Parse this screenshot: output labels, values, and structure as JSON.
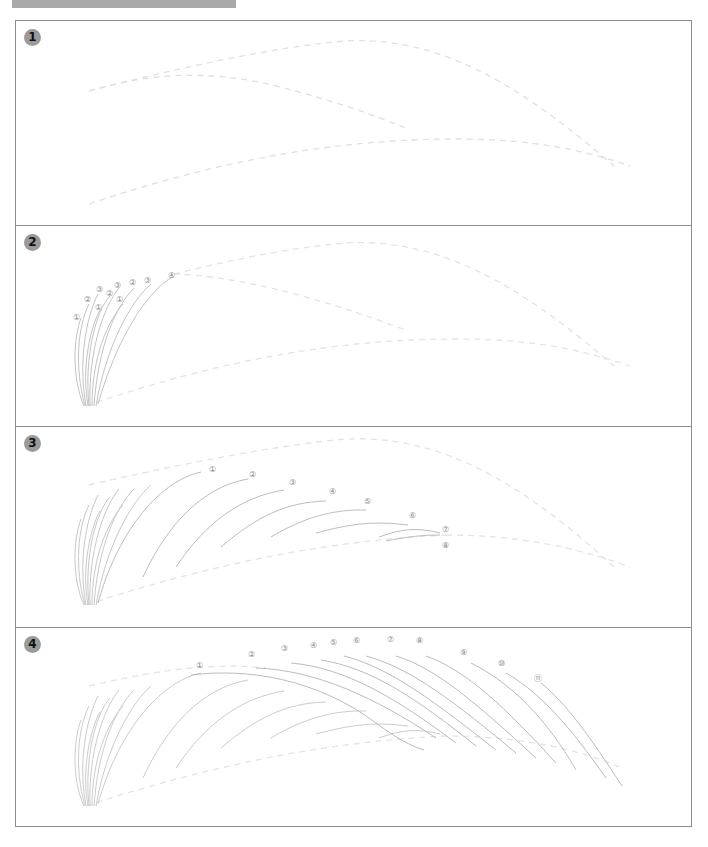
{
  "header": {
    "text": ""
  },
  "colors": {
    "frame_border": "#8c8c8c",
    "badge_bg": "#9a9a9a",
    "guide_dash": "#e3e3e3",
    "stroke": "#c4c4c4",
    "label": "#8a8a8a"
  },
  "panels": [
    {
      "step": "1",
      "labels": []
    },
    {
      "step": "2",
      "labels": [
        "①",
        "②",
        "③",
        "①",
        "②",
        "③",
        "①",
        "②",
        "③",
        "④"
      ]
    },
    {
      "step": "3",
      "labels": [
        "①",
        "②",
        "③",
        "④",
        "⑤",
        "⑥",
        "⑦",
        "⑧"
      ]
    },
    {
      "step": "4",
      "labels": [
        "①",
        "②",
        "③",
        "④",
        "⑤",
        "⑥",
        "⑦",
        "⑧",
        "⑨",
        "⑩",
        "⑪"
      ]
    }
  ]
}
